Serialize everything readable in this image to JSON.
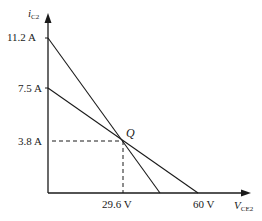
{
  "diagram": {
    "type": "load-line plot",
    "y_axis": {
      "symbol": "i",
      "subscript": "C2"
    },
    "x_axis": {
      "symbol": "V",
      "subscript": "CE2"
    },
    "y_ticks": [
      "11.2 A",
      "7.5 A",
      "3.8 A"
    ],
    "x_ticks": [
      "29.6 V",
      "60 V"
    ],
    "q_point_label": "Q",
    "lines": [
      {
        "name": "steep-load-line",
        "from": "11.2 A",
        "through": "Q"
      },
      {
        "name": "shallow-load-line",
        "from": "7.5 A",
        "to": "60 V",
        "through": "Q"
      }
    ],
    "q_point": {
      "current": "3.8 A",
      "voltage": "29.6 V"
    },
    "color": "#1a1a1a"
  }
}
